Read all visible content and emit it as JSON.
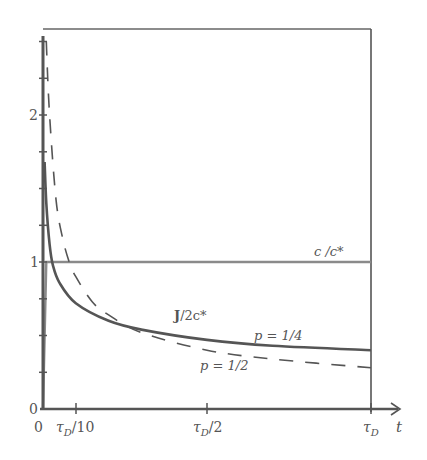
{
  "chart_data": {
    "type": "line",
    "title": "",
    "xlabel": "t",
    "ylabel": "",
    "xlim": [
      0,
      1
    ],
    "ylim": [
      0,
      2.58
    ],
    "x_unit": "τD",
    "x_ticks": [
      {
        "value": 0,
        "label": "0"
      },
      {
        "value": 0.1,
        "label": "τD/10"
      },
      {
        "value": 0.5,
        "label": "τD/2"
      },
      {
        "value": 1.0,
        "label": "τD"
      }
    ],
    "y_ticks": [
      {
        "value": 0,
        "label": "0"
      },
      {
        "value": 1,
        "label": "1"
      },
      {
        "value": 2,
        "label": "2"
      }
    ],
    "y_minor_tick_step": 0.25,
    "grid": false,
    "legend": null,
    "series": [
      {
        "name": "c/c*",
        "style": "solid",
        "color": "#8a8a8a",
        "x": [
          0,
          0.01,
          1.0
        ],
        "y": [
          0,
          1,
          1
        ]
      },
      {
        "name": "J/2c* (p = 1/4)",
        "style": "solid",
        "color": "#555555",
        "x": [
          0.005,
          0.01,
          0.02,
          0.03,
          0.05,
          0.1,
          0.2,
          0.3,
          0.5,
          0.7,
          1.0
        ],
        "y": [
          1.68,
          1.4,
          1.12,
          0.98,
          0.86,
          0.72,
          0.6,
          0.54,
          0.47,
          0.43,
          0.4
        ]
      },
      {
        "name": "J/2c* (p = 1/2)",
        "style": "dashed",
        "color": "#555555",
        "x": [
          0.01,
          0.02,
          0.04,
          0.06,
          0.08,
          0.1,
          0.15,
          0.2,
          0.3,
          0.5,
          0.7,
          1.0
        ],
        "y": [
          2.5,
          2.0,
          1.42,
          1.16,
          1.0,
          0.9,
          0.73,
          0.64,
          0.52,
          0.4,
          0.34,
          0.28
        ]
      }
    ],
    "annotations": [
      {
        "text": "c /c*",
        "x": 0.74,
        "y": 1.1
      },
      {
        "text": "J/2c*",
        "x": 0.27,
        "y": 0.78
      },
      {
        "text": "p = 1/4",
        "x": 0.69,
        "y": 0.52
      },
      {
        "text": "p = 1/2",
        "x": 0.31,
        "y": 0.2
      }
    ]
  },
  "labels": {
    "y0": "0",
    "y1": "1",
    "y2": "2",
    "x0": "0",
    "x_tau10": "τ",
    "x_tau10_sub": "D",
    "x_tau10_rest": "/10",
    "x_tau2": "τ",
    "x_tau2_sub": "D",
    "x_tau2_rest": "/2",
    "x_tau": "τ",
    "x_tau_sub": "D",
    "x_axis_var": "t",
    "c_label": "c /c*",
    "j_label_main": "J",
    "j_label_rest": "/2c*",
    "p_quarter": "p = 1/4",
    "p_half": "p = 1/2"
  }
}
